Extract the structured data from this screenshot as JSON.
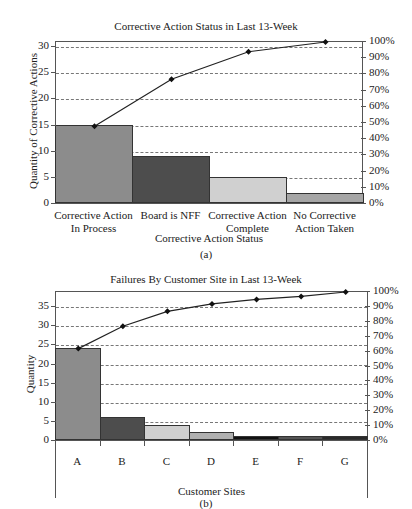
{
  "chart_data": [
    {
      "type": "bar",
      "title": "Corrective Action Status in Last 13-Week",
      "xlabel": "Corrective Action Status",
      "ylabel": "Quantity of Corrective Actions",
      "y2label": "",
      "caption": "(a)",
      "categories": [
        "Corrective Action In Process",
        "Board is NFF",
        "Corrective Action Complete",
        "No Corrective Action Taken"
      ],
      "category_lines": [
        [
          "Corrective Action",
          "In Process"
        ],
        [
          "Board is NFF",
          ""
        ],
        [
          "Corrective Action",
          "Complete"
        ],
        [
          "No Corrective",
          "Action Taken"
        ]
      ],
      "series": [
        {
          "name": "Quantity",
          "type": "bar",
          "values": [
            15,
            9,
            5,
            2
          ],
          "colors": [
            "#8c8c8c",
            "#4d4d4d",
            "#d0d0d0",
            "#a6a6a6"
          ]
        },
        {
          "name": "Cumulative %",
          "type": "line",
          "axis": "right",
          "values": [
            48,
            77,
            94,
            100
          ]
        }
      ],
      "ylim": [
        0,
        31
      ],
      "yticks": [
        "0",
        "5",
        "10",
        "15",
        "20",
        "25",
        "30"
      ],
      "y2lim": [
        0,
        100
      ],
      "y2ticks": [
        "0%",
        "10%",
        "20%",
        "30%",
        "40%",
        "50%",
        "60%",
        "70%",
        "80%",
        "90%",
        "100%"
      ],
      "grid": true,
      "legend": "none"
    },
    {
      "type": "bar",
      "title": "Failures By Customer Site in Last 13-Week",
      "xlabel": "Customer Sites",
      "ylabel": "Quantity",
      "caption": "(b)",
      "categories": [
        "A",
        "B",
        "C",
        "D",
        "E",
        "F",
        "G"
      ],
      "series": [
        {
          "name": "Quantity",
          "type": "bar",
          "values": [
            24,
            6,
            4,
            2,
            1,
            1,
            1
          ],
          "colors": [
            "#8c8c8c",
            "#4d4d4d",
            "#d0d0d0",
            "#b0b0b0",
            "#111111",
            "#555555",
            "#2a2a2a"
          ]
        },
        {
          "name": "Cumulative %",
          "type": "line",
          "axis": "right",
          "values": [
            62,
            77,
            87,
            92,
            95,
            97,
            100
          ]
        }
      ],
      "ylim": [
        0,
        39
      ],
      "yticks": [
        "0",
        "5",
        "10",
        "15",
        "20",
        "25",
        "30",
        "35"
      ],
      "y2lim": [
        0,
        100
      ],
      "y2ticks": [
        "0%",
        "10%",
        "20%",
        "30%",
        "40%",
        "50%",
        "60%",
        "70%",
        "80%",
        "90%",
        "100%"
      ],
      "grid": true,
      "legend": "none"
    }
  ]
}
